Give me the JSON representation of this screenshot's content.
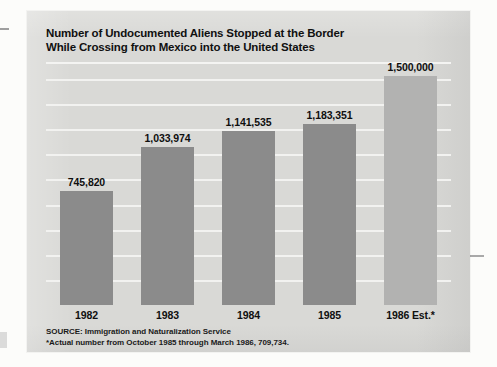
{
  "chart_data": {
    "type": "bar",
    "title": "Number of Undocumented Aliens Stopped at the Border While Crossing from Mexico into the United States",
    "title_line1": "Number of Undocumented Aliens Stopped at the Border",
    "title_line2": "While Crossing from Mexico into the United States",
    "xlabel": "",
    "ylabel": "",
    "categories": [
      "1982",
      "1983",
      "1984",
      "1985",
      "1986 Est.*"
    ],
    "values": [
      745820,
      1033974,
      1141535,
      1183351,
      1500000
    ],
    "value_labels": [
      "745,820",
      "1,033,974",
      "1,141,535",
      "1,183,351",
      "1,500,000"
    ],
    "ylim": [
      0,
      1560000
    ],
    "grid": true,
    "gridlines": 9,
    "legend": "none",
    "bar_colors": [
      "#8b8b8b",
      "#8b8b8b",
      "#8b8b8b",
      "#8b8b8b",
      "#b2b2b1"
    ],
    "source": "SOURCE: Immigration and Naturalization Service",
    "footnote": "*Actual number from October 1985 through March 1986, 709,734."
  },
  "card": {
    "background_color": "#d9d9d6",
    "gridline_color": "#f2f2f0",
    "text_color": "#101010"
  }
}
